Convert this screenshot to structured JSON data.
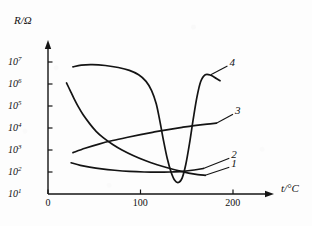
{
  "chart_data": {
    "type": "line",
    "title": "",
    "xlabel": "t/°C",
    "ylabel": "R/Ω",
    "xlim": [
      0,
      230
    ],
    "ylim": [
      1,
      7
    ],
    "yscale": "log",
    "grid": false,
    "legend_position": "inline-right-labels",
    "x_ticks": [
      {
        "value": 0,
        "label": "0"
      },
      {
        "value": 100,
        "label": "100"
      },
      {
        "value": 200,
        "label": "200"
      }
    ],
    "y_ticks": [
      {
        "exponent": 1,
        "mantissa": "10",
        "label": "10",
        "sup": "1"
      },
      {
        "exponent": 2,
        "mantissa": "10",
        "label": "10",
        "sup": "2"
      },
      {
        "exponent": 3,
        "mantissa": "10",
        "label": "10",
        "sup": "3"
      },
      {
        "exponent": 4,
        "mantissa": "10",
        "label": "10",
        "sup": "4"
      },
      {
        "exponent": 5,
        "mantissa": "10",
        "label": "10",
        "sup": "5"
      },
      {
        "exponent": 6,
        "mantissa": "10",
        "label": "10",
        "sup": "6"
      },
      {
        "exponent": 7,
        "mantissa": "10",
        "label": "10",
        "sup": "7"
      }
    ],
    "series": [
      {
        "name": "1",
        "label": "1",
        "points": [
          [
            20,
            6.05
          ],
          [
            24,
            5.7
          ],
          [
            28,
            5.35
          ],
          [
            33,
            4.95
          ],
          [
            38,
            4.6
          ],
          [
            45,
            4.2
          ],
          [
            52,
            3.85
          ],
          [
            60,
            3.55
          ],
          [
            70,
            3.25
          ],
          [
            80,
            3.0
          ],
          [
            92,
            2.75
          ],
          [
            105,
            2.52
          ],
          [
            118,
            2.33
          ],
          [
            130,
            2.18
          ],
          [
            142,
            2.05
          ],
          [
            152,
            1.95
          ],
          [
            162,
            1.88
          ],
          [
            170,
            1.85
          ]
        ]
      },
      {
        "name": "2",
        "label": "2",
        "points": [
          [
            25,
            2.42
          ],
          [
            35,
            2.3
          ],
          [
            45,
            2.22
          ],
          [
            58,
            2.14
          ],
          [
            72,
            2.08
          ],
          [
            88,
            2.03
          ],
          [
            104,
            2.0
          ],
          [
            118,
            1.99
          ],
          [
            132,
            2.0
          ],
          [
            146,
            2.03
          ],
          [
            158,
            2.09
          ],
          [
            168,
            2.16
          ]
        ]
      },
      {
        "name": "3",
        "label": "3",
        "points": [
          [
            27,
            2.88
          ],
          [
            40,
            3.08
          ],
          [
            55,
            3.27
          ],
          [
            70,
            3.43
          ],
          [
            85,
            3.57
          ],
          [
            100,
            3.7
          ],
          [
            115,
            3.82
          ],
          [
            130,
            3.93
          ],
          [
            145,
            4.03
          ],
          [
            158,
            4.11
          ],
          [
            172,
            4.18
          ],
          [
            182,
            4.22
          ]
        ]
      },
      {
        "name": "4",
        "label": "4",
        "points": [
          [
            27,
            6.78
          ],
          [
            36,
            6.86
          ],
          [
            48,
            6.88
          ],
          [
            62,
            6.84
          ],
          [
            76,
            6.75
          ],
          [
            88,
            6.62
          ],
          [
            98,
            6.42
          ],
          [
            106,
            6.12
          ],
          [
            112,
            5.7
          ],
          [
            117,
            5.1
          ],
          [
            121,
            4.3
          ],
          [
            125,
            3.4
          ],
          [
            129,
            2.6
          ],
          [
            133,
            2.0
          ],
          [
            137,
            1.62
          ],
          [
            141,
            1.52
          ],
          [
            145,
            1.72
          ],
          [
            149,
            2.35
          ],
          [
            153,
            3.3
          ],
          [
            157,
            4.4
          ],
          [
            161,
            5.4
          ],
          [
            165,
            6.1
          ],
          [
            170,
            6.42
          ],
          [
            176,
            6.4
          ],
          [
            182,
            6.25
          ],
          [
            186,
            6.15
          ]
        ]
      }
    ],
    "annotations": [
      {
        "name": "1",
        "leader_from": [
          170,
          1.85
        ],
        "leader_to": [
          196,
          2.22
        ]
      },
      {
        "name": "2",
        "leader_from": [
          168,
          2.16
        ],
        "leader_to": [
          196,
          2.62
        ]
      },
      {
        "name": "3",
        "leader_from": [
          182,
          4.22
        ],
        "leader_to": [
          200,
          4.62
        ]
      },
      {
        "name": "4",
        "leader_from": [
          176,
          6.42
        ],
        "leader_to": [
          194,
          6.82
        ]
      }
    ]
  },
  "labels": {
    "y_axis_title": "R/Ω",
    "x_axis_title": "t/°C",
    "curve_1": "1",
    "curve_2": "2",
    "curve_3": "3",
    "curve_4": "4",
    "x_tick_0": "0",
    "x_tick_100": "100",
    "x_tick_200": "200"
  },
  "colors": {
    "ink": "#141414",
    "background": "#fdfdfd"
  }
}
